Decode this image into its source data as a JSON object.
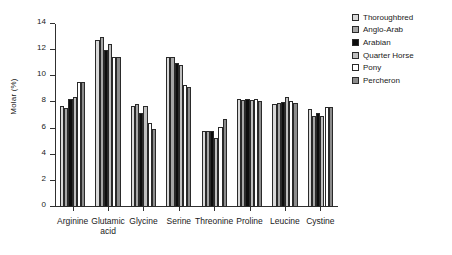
{
  "chart_data": {
    "type": "bar",
    "title": "",
    "xlabel": "",
    "ylabel": "Molar (%)",
    "ylim": [
      0,
      14
    ],
    "ytick_step": 2,
    "yticks": [
      0,
      2,
      4,
      6,
      8,
      10,
      12,
      14
    ],
    "ytick_labels": [
      "0",
      "2",
      "4",
      "6",
      "8",
      "10",
      "12",
      "14"
    ],
    "grid": false,
    "legend_position": "top-right",
    "categories": [
      "Arginine",
      "Glutamic acid",
      "Glycine",
      "Serine",
      "Threonine",
      "Proline",
      "Leucine",
      "Cystine"
    ],
    "category_lines": [
      [
        "Arginine"
      ],
      [
        "Glutamic",
        "acid"
      ],
      [
        "Glycine"
      ],
      [
        "Serine"
      ],
      [
        "Threonine"
      ],
      [
        "Proline"
      ],
      [
        "Leucine"
      ],
      [
        "Cystine"
      ]
    ],
    "series": [
      {
        "name": "Thoroughbred",
        "color": "#d9d9d9",
        "values": [
          7.7,
          12.8,
          7.7,
          11.5,
          5.8,
          8.3,
          7.9,
          7.5
        ]
      },
      {
        "name": "Anglo-Arab",
        "color": "#a6a6a6",
        "values": [
          7.6,
          13.0,
          7.9,
          11.45,
          5.8,
          8.2,
          7.95,
          7.0
        ]
      },
      {
        "name": "Arabian",
        "color": "#0d0d0d",
        "values": [
          8.3,
          12.0,
          7.2,
          11.05,
          5.85,
          8.25,
          8.05,
          7.2
        ]
      },
      {
        "name": "Quarter Horse",
        "color": "#bfbfbf",
        "values": [
          8.45,
          12.5,
          7.7,
          10.85,
          5.25,
          8.15,
          8.4,
          7.0
        ]
      },
      {
        "name": "Pony",
        "color": "#ffffff",
        "values": [
          9.55,
          11.45,
          6.4,
          9.3,
          6.1,
          8.25,
          8.1,
          7.65
        ]
      },
      {
        "name": "Percheron",
        "color": "#8c8c8c",
        "values": [
          9.55,
          11.45,
          6.0,
          9.15,
          6.75,
          8.1,
          7.95,
          7.65
        ]
      }
    ]
  }
}
